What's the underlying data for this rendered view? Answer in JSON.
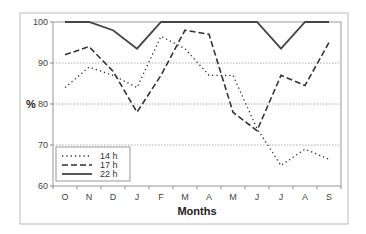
{
  "chart_data": {
    "type": "line",
    "title": "",
    "xlabel": "Months",
    "ylabel": "%",
    "categories": [
      "O",
      "N",
      "D",
      "J",
      "F",
      "M",
      "A",
      "M",
      "J",
      "J",
      "A",
      "S"
    ],
    "ylim": [
      60,
      100
    ],
    "yticks": [
      60,
      70,
      80,
      90,
      100
    ],
    "grid": "horizontal dotted",
    "legend_position": "lower-left inside",
    "series": [
      {
        "name": "14 h",
        "style": "dotted",
        "values": [
          84,
          89,
          87,
          84,
          96.5,
          93.5,
          87,
          87,
          74,
          65,
          69,
          66.5
        ]
      },
      {
        "name": "17 h",
        "style": "dashed",
        "values": [
          92,
          94,
          88,
          78,
          87,
          98,
          97,
          78,
          73.5,
          87,
          84.5,
          95
        ]
      },
      {
        "name": "22 h",
        "style": "solid",
        "values": [
          100,
          100,
          98,
          93.5,
          100,
          100,
          100,
          100,
          100,
          93.5,
          100,
          100
        ]
      }
    ]
  },
  "labels": {
    "y_axis_title": "%",
    "x_axis_title": "Months",
    "legend": [
      "14 h",
      "17 h",
      "22 h"
    ]
  }
}
